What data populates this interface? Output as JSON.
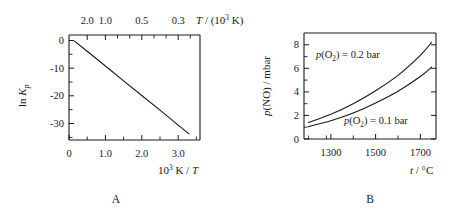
{
  "figure": {
    "panel_a_letter": "A",
    "panel_b_letter": "B"
  },
  "panel_a": {
    "y_axis_label_parts": {
      "ln": "ln ",
      "k": "K",
      "p": "p"
    },
    "x_axis_label_parts": {
      "ten": "10",
      "exp": "3",
      "k_over": " K / ",
      "t": "T"
    },
    "top_axis_label_parts": {
      "t": "T",
      "slash_open": " / (10",
      "exp": "3",
      "close": " K)"
    },
    "y_ticks": [
      "0",
      "-10",
      "-20",
      "-30"
    ],
    "x_ticks": [
      "0",
      "1.0",
      "2.0",
      "3.0"
    ],
    "top_ticks": [
      "2.0",
      "1.0",
      "0.5",
      "0.3"
    ]
  },
  "panel_b": {
    "y_axis_label_parts": {
      "p": "p",
      "no": "(NO)",
      "unit": " / mbar"
    },
    "x_axis_label_parts": {
      "t": "t",
      "unit": " / °C"
    },
    "y_ticks": [
      "0",
      "2",
      "4",
      "6",
      "8"
    ],
    "x_ticks": [
      "1300",
      "1500",
      "1700"
    ],
    "annotation_upper": {
      "p": "p",
      "o": "(O",
      "sub": "2",
      "rest": ") = 0.2 bar"
    },
    "annotation_lower": {
      "p": "p",
      "o": "(O",
      "sub": "2",
      "rest": ") = 0.1 bar"
    }
  },
  "chart_data": [
    {
      "type": "line",
      "id": "panel-A",
      "title": "A",
      "xlabel": "10^3 K / T",
      "ylabel": "ln K_p",
      "top_axis_label": "T / (10^3 K)",
      "xlim": [
        0,
        3.6
      ],
      "ylim": [
        -36,
        2
      ],
      "grid": false,
      "legend": "none",
      "xticks": [
        0,
        1.0,
        2.0,
        3.0
      ],
      "yticks": [
        0,
        -10,
        -20,
        -30
      ],
      "top_axis_ticks": [
        2.0,
        1.0,
        0.5,
        0.3
      ],
      "top_axis_note": "reciprocal temperature scale: position = 1000/(T in K) mapped onto the 10^3 K/T axis",
      "series": [
        {
          "name": "ln K_p vs 10^3 K/T",
          "x": [
            0.15,
            0.5,
            1.0,
            1.5,
            2.0,
            2.5,
            3.0,
            3.3
          ],
          "y": [
            -0.2,
            -3.9,
            -9.2,
            -14.6,
            -19.9,
            -25.2,
            -30.6,
            -33.8
          ]
        }
      ]
    },
    {
      "type": "line",
      "id": "panel-B",
      "title": "B",
      "xlabel": "t / °C",
      "ylabel": "p(NO) / mbar",
      "xlim": [
        1180,
        1770
      ],
      "ylim": [
        0,
        9
      ],
      "grid": false,
      "legend": "inline annotations",
      "xticks": [
        1300,
        1500,
        1700
      ],
      "yticks": [
        0,
        2,
        4,
        6,
        8
      ],
      "series": [
        {
          "name": "p(O2) = 0.2 bar",
          "x": [
            1200,
            1300,
            1400,
            1500,
            1600,
            1700,
            1750
          ],
          "y": [
            1.4,
            2.1,
            3.0,
            4.1,
            5.4,
            7.1,
            8.2
          ]
        },
        {
          "name": "p(O2) = 0.1 bar",
          "x": [
            1200,
            1300,
            1400,
            1500,
            1600,
            1700,
            1750
          ],
          "y": [
            1.05,
            1.55,
            2.2,
            3.05,
            4.05,
            5.3,
            6.1
          ]
        }
      ]
    }
  ]
}
